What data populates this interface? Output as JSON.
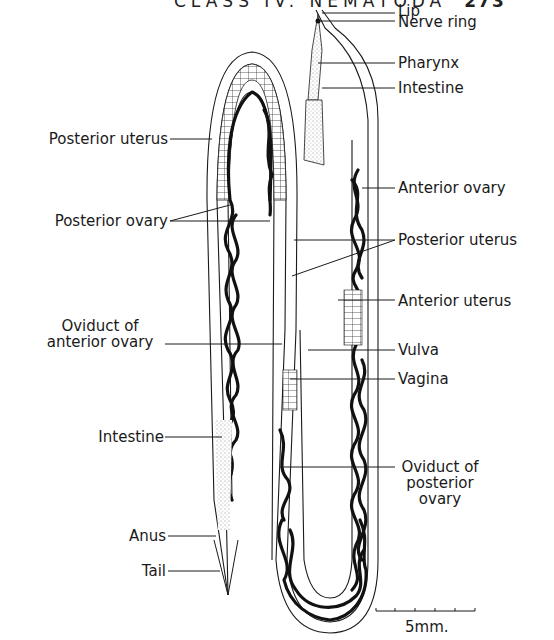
{
  "header": {
    "running_title": "CLASS IV. NEMATODA",
    "page_number": "273"
  },
  "figure": {
    "labels_right": [
      {
        "id": "lip",
        "text": "Lip"
      },
      {
        "id": "nerve-ring",
        "text": "Nerve ring"
      },
      {
        "id": "pharynx",
        "text": "Pharynx"
      },
      {
        "id": "intestine-anterior",
        "text": "Intestine"
      },
      {
        "id": "anterior-ovary",
        "text": "Anterior ovary"
      },
      {
        "id": "posterior-uterus-right",
        "text": "Posterior uterus"
      },
      {
        "id": "anterior-uterus",
        "text": "Anterior uterus"
      },
      {
        "id": "vulva",
        "text": "Vulva"
      },
      {
        "id": "vagina",
        "text": "Vagina"
      },
      {
        "id": "oviduct-posterior-ovary",
        "text_lines": [
          "Oviduct of",
          "posterior",
          "ovary"
        ]
      }
    ],
    "labels_left": [
      {
        "id": "posterior-uterus-left",
        "text": "Posterior uterus"
      },
      {
        "id": "posterior-ovary",
        "text": "Posterior ovary"
      },
      {
        "id": "oviduct-anterior-ovary",
        "text_lines": [
          "Oviduct of",
          "anterior ovary"
        ]
      },
      {
        "id": "intestine-posterior",
        "text": "Intestine"
      },
      {
        "id": "anus",
        "text": "Anus"
      },
      {
        "id": "tail",
        "text": "Tail"
      }
    ],
    "scale_bar": {
      "label": "5mm.",
      "ticks": 6
    },
    "colors": {
      "ink": "#1a1a1a",
      "background": "#ffffff",
      "stipple": "#bdbdbd"
    }
  }
}
